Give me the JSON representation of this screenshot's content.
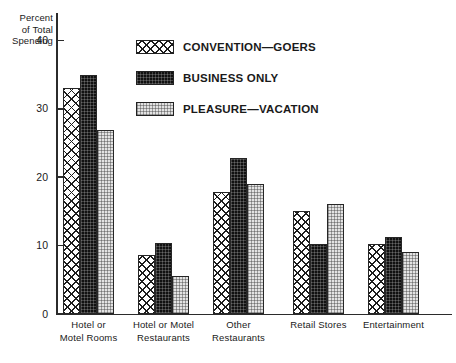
{
  "chart_data": {
    "type": "bar",
    "title": "",
    "subtitle": "",
    "xlabel": "",
    "ylabel": "Percent of Total Spending",
    "ylabel_lines": [
      "Percent",
      "of Total",
      "Spending"
    ],
    "ylim": [
      0,
      44
    ],
    "yticks": [
      0,
      10,
      20,
      30,
      40
    ],
    "ytick_labels": [
      "0",
      "10",
      "20",
      "30",
      "40"
    ],
    "grid": false,
    "legend_position": "upper-center-right",
    "categories": [
      "Hotel or Motel Rooms",
      "Hotel or Motel Restaurants",
      "Other Restaurants",
      "Retail Stores",
      "Entertainment"
    ],
    "category_label_lines": [
      [
        "Hotel or",
        "Motel Rooms"
      ],
      [
        "Hotel or Motel",
        "Restaurants"
      ],
      [
        "Other",
        "Restaurants"
      ],
      [
        "Retail Stores",
        ""
      ],
      [
        "Entertainment",
        ""
      ]
    ],
    "series": [
      {
        "name": "CONVENTION—GOERS",
        "pattern": "cross-hatch",
        "color": "#ffffff",
        "values": [
          33.0,
          8.6,
          17.8,
          15.0,
          10.2
        ]
      },
      {
        "name": "BUSINESS ONLY",
        "pattern": "solid-dark",
        "color": "#111111",
        "values": [
          34.9,
          10.4,
          22.8,
          10.3,
          11.2
        ]
      },
      {
        "name": "PLEASURE—VACATION",
        "pattern": "light-stipple",
        "color": "#e3e3e3",
        "values": [
          26.9,
          5.5,
          19.0,
          16.1,
          9.1
        ]
      }
    ]
  },
  "legend": {
    "items": [
      {
        "label": "CONVENTION—GOERS"
      },
      {
        "label": "BUSINESS ONLY"
      },
      {
        "label": "PLEASURE—VACATION"
      }
    ]
  }
}
